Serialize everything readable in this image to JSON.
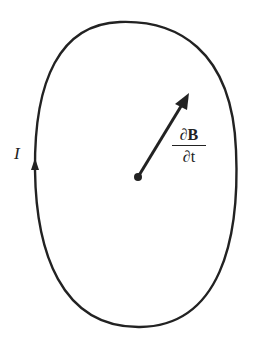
{
  "diagram": {
    "current_label": "I",
    "vector_label": {
      "numerator_prefix": "∂",
      "numerator_symbol": "B",
      "denominator": "∂t"
    },
    "colors": {
      "stroke": "#222222",
      "background": "#ffffff"
    }
  }
}
